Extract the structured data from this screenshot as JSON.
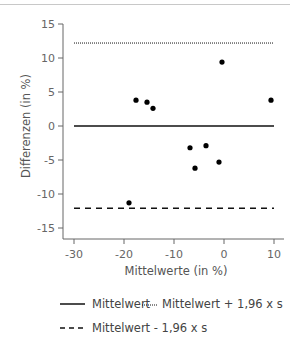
{
  "chart_data": {
    "type": "scatter",
    "title": "",
    "xlabel": "Mittelwerte (in %)",
    "ylabel": "Differenzen (in %)",
    "xlim": [
      -30,
      12
    ],
    "ylim": [
      -16.5,
      15
    ],
    "x_ticks": [
      -30,
      -20,
      -10,
      0,
      10
    ],
    "y_ticks": [
      15,
      10,
      5,
      0,
      -5,
      -10,
      -15
    ],
    "grid": false,
    "points": [
      {
        "x": -17.6,
        "y": 3.8
      },
      {
        "x": -15.4,
        "y": 3.5
      },
      {
        "x": -14.2,
        "y": 2.6
      },
      {
        "x": -0.4,
        "y": 9.4
      },
      {
        "x": 9.4,
        "y": 3.8
      },
      {
        "x": -6.8,
        "y": -3.2
      },
      {
        "x": -3.6,
        "y": -2.9
      },
      {
        "x": -5.8,
        "y": -6.2
      },
      {
        "x": -1.0,
        "y": -5.3
      },
      {
        "x": -19.0,
        "y": -11.3
      }
    ],
    "reference_lines": [
      {
        "name": "Mittelwert",
        "y": 0,
        "style": "solid",
        "x_from": -30,
        "x_to": 10
      },
      {
        "name": "Mittelwert + 1,96 x s",
        "y": 12.2,
        "style": "dotted",
        "x_from": -30,
        "x_to": 10
      },
      {
        "name": "Mittelwert - 1,96 x s",
        "y": -12.1,
        "style": "dashed",
        "x_from": -30,
        "x_to": 10
      }
    ],
    "legend": {
      "position": "bottom",
      "entries": [
        {
          "label": "Mittelwert",
          "style": "solid"
        },
        {
          "label": "Mittelwert + 1,96 x s",
          "style": "dotted"
        },
        {
          "label": "Mittelwert - 1,96 x s",
          "style": "dashed"
        }
      ]
    }
  },
  "labels": {
    "xlabel": "Mittelwerte (in %)",
    "ylabel": "Differenzen (in %)",
    "legend_mean": "Mittelwert",
    "legend_upper": "Mittelwert + 1,96 x s",
    "legend_lower": "Mittelwert - 1,96 x s"
  },
  "colors": {
    "axis": "#666666",
    "points": "#000000",
    "lines": "#111111",
    "text": "#555555"
  }
}
